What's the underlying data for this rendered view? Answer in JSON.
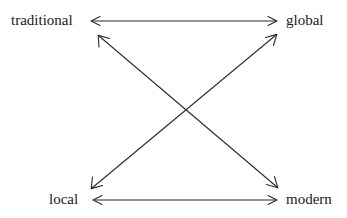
{
  "diagram": {
    "type": "two-axis-crossed-arrow-diagram",
    "background_color": "#ffffff",
    "line_color": "#2b2b2b",
    "nodes": [
      {
        "id": "traditional",
        "label": "traditional",
        "position": "top-left",
        "x": 11,
        "y": 12
      },
      {
        "id": "global",
        "label": "global",
        "position": "top-right",
        "x": 286,
        "y": 12
      },
      {
        "id": "local",
        "label": "local",
        "position": "bottom-left",
        "x": 49,
        "y": 191
      },
      {
        "id": "modern",
        "label": "modern",
        "position": "bottom-right",
        "x": 286,
        "y": 191
      }
    ],
    "connections": [
      {
        "id": "traditional-global",
        "from": "traditional",
        "to": "global",
        "style": "double-headed",
        "orientation": "horizontal-top"
      },
      {
        "id": "local-modern",
        "from": "local",
        "to": "modern",
        "style": "double-headed",
        "orientation": "horizontal-bottom"
      },
      {
        "id": "traditional-modern",
        "from": "traditional",
        "to": "modern",
        "style": "double-headed",
        "orientation": "diagonal-descending"
      },
      {
        "id": "local-global",
        "from": "local",
        "to": "global",
        "style": "double-headed",
        "orientation": "diagonal-ascending"
      }
    ]
  }
}
